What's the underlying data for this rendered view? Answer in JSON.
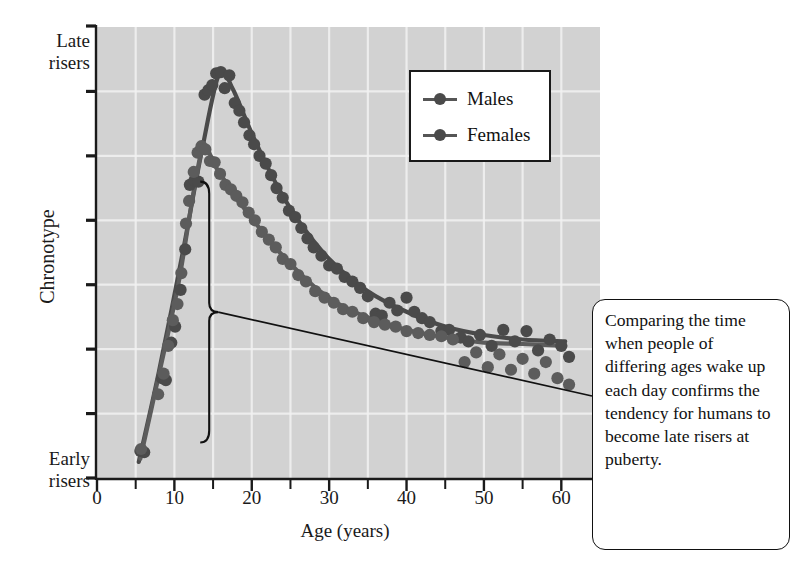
{
  "axes": {
    "y_top_label": "Late\nrisers",
    "y_top_label_line1": "Late",
    "y_top_label_line2": "risers",
    "y_bottom_label_line1": "Early",
    "y_bottom_label_line2": "risers",
    "y_axis_title": "Chronotype",
    "x_axis_title": "Age (years)",
    "x_ticks": [
      "0",
      "10",
      "20",
      "30",
      "40",
      "50",
      "60"
    ]
  },
  "legend": {
    "items": [
      {
        "label": "Males",
        "color": "#4a4a4a"
      },
      {
        "label": "Females",
        "color": "#555555"
      }
    ]
  },
  "callout": {
    "text": "Comparing the time when people of differing ages wake up each day confirms the tendency for humans to become late risers at puberty."
  },
  "colors": {
    "panel_background": "#d2d2d2",
    "gridline": "#f2f2f2",
    "axis": "#1a1a1a",
    "males": "#4a4a4a",
    "females": "#5c5c5c",
    "callout_border": "#111111"
  },
  "chart_data": {
    "type": "scatter",
    "title": "",
    "xlabel": "Age (years)",
    "ylabel": "Chronotype",
    "xlim": [
      0,
      65
    ],
    "ylim": [
      0,
      7
    ],
    "grid": true,
    "legend_position": "top-right",
    "y_axis_annotations": {
      "top": "Late risers",
      "bottom": "Early risers",
      "note": "Y axis is a qualitative chronotype scale; 7 tick marks, no numeric labels"
    },
    "x_major_ticks": [
      0,
      10,
      20,
      30,
      40,
      50,
      60
    ],
    "x_minor_ticks": [
      5,
      15,
      25,
      35,
      45,
      55
    ],
    "series": [
      {
        "name": "Males",
        "color": "#4a4a4a",
        "points": [
          [
            5.6,
            0.42
          ],
          [
            6.1,
            0.4
          ],
          [
            8.4,
            1.55
          ],
          [
            8.9,
            1.52
          ],
          [
            9.6,
            2.1
          ],
          [
            10.1,
            2.35
          ],
          [
            10.8,
            2.92
          ],
          [
            11.4,
            3.55
          ],
          [
            12.0,
            4.55
          ],
          [
            12.6,
            4.62
          ],
          [
            13.1,
            4.6
          ],
          [
            13.9,
            5.95
          ],
          [
            14.4,
            6.02
          ],
          [
            14.9,
            6.1
          ],
          [
            15.4,
            6.28
          ],
          [
            16.0,
            6.3
          ],
          [
            16.5,
            6.05
          ],
          [
            17.1,
            6.25
          ],
          [
            17.8,
            5.82
          ],
          [
            18.4,
            5.7
          ],
          [
            19.0,
            5.52
          ],
          [
            19.7,
            5.32
          ],
          [
            20.3,
            5.18
          ],
          [
            21.0,
            5.0
          ],
          [
            21.8,
            4.88
          ],
          [
            22.5,
            4.7
          ],
          [
            23.2,
            4.5
          ],
          [
            24.0,
            4.35
          ],
          [
            24.8,
            4.15
          ],
          [
            25.6,
            4.05
          ],
          [
            26.4,
            3.88
          ],
          [
            27.2,
            3.72
          ],
          [
            28.0,
            3.58
          ],
          [
            29.0,
            3.45
          ],
          [
            30.0,
            3.3
          ],
          [
            31.0,
            3.25
          ],
          [
            32.0,
            3.12
          ],
          [
            33.0,
            3.05
          ],
          [
            34.0,
            2.95
          ],
          [
            35.0,
            2.82
          ],
          [
            36.0,
            2.55
          ],
          [
            36.8,
            2.52
          ],
          [
            37.8,
            2.72
          ],
          [
            38.8,
            2.6
          ],
          [
            40.0,
            2.8
          ],
          [
            41.0,
            2.58
          ],
          [
            42.0,
            2.48
          ],
          [
            43.0,
            2.42
          ],
          [
            44.5,
            2.28
          ],
          [
            45.5,
            2.3
          ],
          [
            47.0,
            2.18
          ],
          [
            48.0,
            2.12
          ],
          [
            49.5,
            2.22
          ],
          [
            51.0,
            2.05
          ],
          [
            52.5,
            2.3
          ],
          [
            54.0,
            2.12
          ],
          [
            55.5,
            2.28
          ],
          [
            57.0,
            1.98
          ],
          [
            58.5,
            2.15
          ],
          [
            60.0,
            2.05
          ],
          [
            61.0,
            1.88
          ]
        ],
        "trend": [
          [
            5.4,
            0.25
          ],
          [
            8.0,
            1.65
          ],
          [
            11.0,
            3.45
          ],
          [
            13.5,
            5.05
          ],
          [
            15.8,
            6.28
          ],
          [
            17.5,
            6.05
          ],
          [
            20.0,
            5.35
          ],
          [
            23.0,
            4.6
          ],
          [
            26.0,
            4.0
          ],
          [
            30.0,
            3.4
          ],
          [
            35.0,
            2.9
          ],
          [
            40.0,
            2.58
          ],
          [
            45.0,
            2.35
          ],
          [
            50.0,
            2.22
          ],
          [
            55.0,
            2.15
          ],
          [
            60.5,
            2.12
          ]
        ]
      },
      {
        "name": "Females",
        "color": "#5c5c5c",
        "points": [
          [
            5.7,
            0.45
          ],
          [
            7.9,
            1.3
          ],
          [
            8.6,
            1.62
          ],
          [
            9.2,
            2.05
          ],
          [
            9.8,
            2.45
          ],
          [
            10.4,
            2.7
          ],
          [
            10.9,
            3.18
          ],
          [
            11.5,
            3.95
          ],
          [
            11.9,
            4.3
          ],
          [
            12.5,
            4.75
          ],
          [
            13.0,
            5.05
          ],
          [
            13.5,
            5.15
          ],
          [
            14.0,
            5.1
          ],
          [
            14.6,
            4.92
          ],
          [
            15.2,
            4.9
          ],
          [
            15.9,
            4.72
          ],
          [
            16.6,
            4.55
          ],
          [
            17.3,
            4.48
          ],
          [
            18.0,
            4.38
          ],
          [
            18.8,
            4.28
          ],
          [
            19.6,
            4.12
          ],
          [
            20.4,
            4.0
          ],
          [
            21.3,
            3.82
          ],
          [
            22.2,
            3.7
          ],
          [
            23.1,
            3.58
          ],
          [
            24.0,
            3.4
          ],
          [
            25.0,
            3.32
          ],
          [
            26.0,
            3.15
          ],
          [
            27.0,
            3.05
          ],
          [
            28.2,
            2.9
          ],
          [
            29.4,
            2.8
          ],
          [
            30.6,
            2.72
          ],
          [
            31.8,
            2.62
          ],
          [
            33.0,
            2.58
          ],
          [
            34.4,
            2.48
          ],
          [
            35.8,
            2.42
          ],
          [
            37.2,
            2.38
          ],
          [
            38.6,
            2.35
          ],
          [
            40.0,
            2.28
          ],
          [
            41.5,
            2.25
          ],
          [
            43.0,
            2.22
          ],
          [
            44.5,
            2.2
          ],
          [
            46.0,
            2.15
          ],
          [
            47.5,
            1.8
          ],
          [
            49.0,
            1.95
          ],
          [
            50.5,
            1.72
          ],
          [
            52.0,
            1.92
          ],
          [
            53.5,
            1.68
          ],
          [
            55.0,
            1.85
          ],
          [
            56.5,
            1.62
          ],
          [
            58.0,
            1.8
          ],
          [
            59.5,
            1.55
          ],
          [
            61.0,
            1.45
          ]
        ],
        "trend": [
          [
            5.6,
            0.3
          ],
          [
            8.0,
            1.6
          ],
          [
            10.5,
            3.0
          ],
          [
            12.5,
            4.45
          ],
          [
            13.8,
            5.12
          ],
          [
            15.5,
            4.8
          ],
          [
            18.0,
            4.35
          ],
          [
            21.0,
            3.88
          ],
          [
            24.0,
            3.45
          ],
          [
            28.0,
            2.98
          ],
          [
            32.0,
            2.65
          ],
          [
            36.0,
            2.45
          ],
          [
            40.0,
            2.3
          ],
          [
            45.0,
            2.18
          ],
          [
            50.0,
            2.1
          ],
          [
            55.0,
            2.08
          ],
          [
            60.5,
            2.05
          ]
        ]
      }
    ],
    "annotations": [
      {
        "type": "brace",
        "label": "puberty-range-brace",
        "x": 14.5,
        "y_from": 4.6,
        "y_to": 0.55,
        "note": "Curly brace marking the puberty age span on the rising limb"
      }
    ]
  }
}
